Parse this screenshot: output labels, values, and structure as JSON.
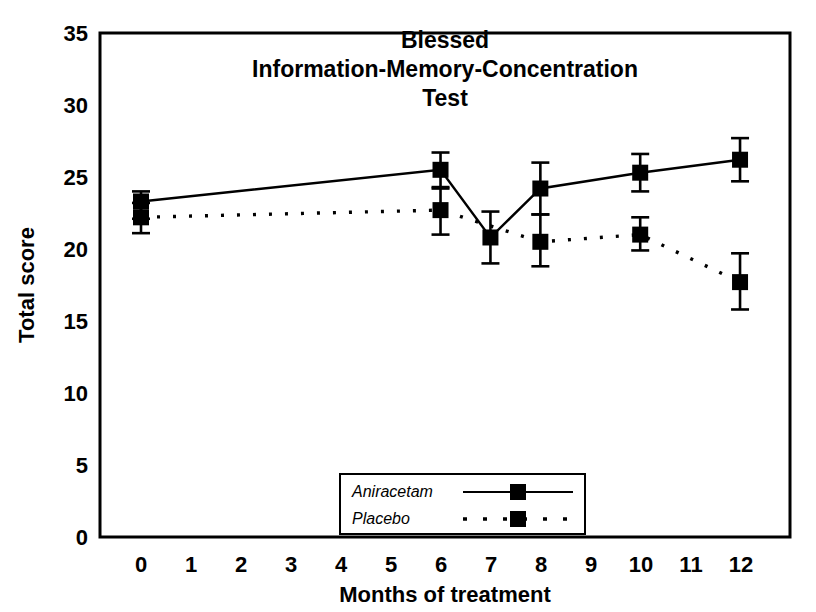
{
  "chart_data": {
    "type": "line",
    "title": "Blessed Information-Memory-Concentration Test",
    "title_lines": [
      "Blessed",
      "Information-Memory-Concentration",
      "Test"
    ],
    "xlabel": "Months of treatment",
    "ylabel": "Total score",
    "xlim": [
      0,
      12
    ],
    "ylim": [
      0,
      35
    ],
    "xticks": [
      0,
      1,
      2,
      3,
      4,
      5,
      6,
      7,
      8,
      9,
      10,
      11,
      12
    ],
    "yticks": [
      0,
      5,
      10,
      15,
      20,
      25,
      30,
      35
    ],
    "grid": false,
    "legend_position": "bottom-center",
    "error_bars": "standard error",
    "series": [
      {
        "name": "Aniracetam",
        "linestyle": "solid",
        "marker": "filled-square",
        "color": "#000000",
        "x": [
          0,
          6,
          7,
          8,
          10,
          12
        ],
        "values": [
          23.3,
          25.5,
          20.8,
          24.2,
          25.3,
          26.2
        ],
        "err_low": [
          22.1,
          24.2,
          19.0,
          22.4,
          24.0,
          24.7
        ],
        "err_high": [
          24.0,
          26.7,
          22.6,
          26.0,
          26.6,
          27.7
        ]
      },
      {
        "name": "Placebo",
        "linestyle": "dashed",
        "marker": "filled-square",
        "color": "#000000",
        "x": [
          0,
          6,
          8,
          10,
          12
        ],
        "values": [
          22.2,
          22.7,
          20.5,
          21.0,
          17.7
        ],
        "err_low": [
          21.1,
          21.0,
          18.8,
          19.9,
          15.8
        ],
        "err_high": [
          23.2,
          24.3,
          22.4,
          22.2,
          19.7
        ]
      }
    ]
  },
  "legend": {
    "items": [
      {
        "label": "Aniracetam",
        "style": "solid"
      },
      {
        "label": "Placebo",
        "style": "dashed"
      }
    ]
  },
  "axes": {
    "y_title": "Total score",
    "x_title": "Months of treatment",
    "y_tick_labels": [
      "35",
      "30",
      "25",
      "20",
      "15",
      "10",
      "5",
      "0"
    ],
    "x_tick_labels": [
      "0",
      "1",
      "2",
      "3",
      "4",
      "5",
      "6",
      "7",
      "8",
      "9",
      "10",
      "11",
      "12"
    ]
  },
  "colors": {
    "ink": "#000000",
    "paper": "#ffffff"
  }
}
